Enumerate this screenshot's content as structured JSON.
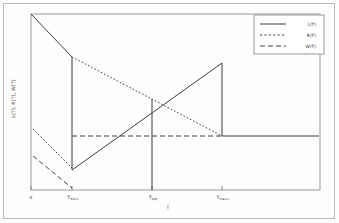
{
  "chart_data": {
    "type": "line",
    "title": "",
    "xlabel": "T",
    "ylabel": "L(T), R(T), W(T)",
    "grid": false,
    "legend_position": "top-right",
    "xlim": [
      0,
      1
    ],
    "ylim": [
      0,
      1
    ],
    "xticks": [
      {
        "pos": 0.0,
        "label": "0",
        "sub": ""
      },
      {
        "pos": 0.142,
        "label": "T",
        "sub": "min,L"
      },
      {
        "pos": 0.662,
        "label": "T",
        "sub": "opt"
      },
      {
        "pos": 0.662,
        "label": "T",
        "sub": "max,L"
      }
    ],
    "tick_labels": [
      "0",
      "T",
      "T",
      "T"
    ],
    "tick_subs": [
      "",
      "min,L",
      "opt",
      "max,L"
    ],
    "series": [
      {
        "name": "L(T)",
        "style": "solid",
        "color": "#3a3a3a",
        "points": [
          [
            0.0,
            1.0
          ],
          [
            0.142,
            0.76
          ],
          [
            0.142,
            0.115
          ],
          [
            0.662,
            0.72
          ],
          [
            0.662,
            0.305
          ],
          [
            1.0,
            0.305
          ]
        ]
      },
      {
        "name": "R(T)",
        "style": "dotted",
        "color": "#3a3a3a",
        "points": [
          [
            0.0,
            0.345
          ],
          [
            0.142,
            0.125
          ],
          [
            0.142,
            0.76
          ],
          [
            0.662,
            0.305
          ]
        ]
      },
      {
        "name": "W(T)",
        "style": "dashed",
        "color": "#3a3a3a",
        "points": [
          [
            0.0,
            0.195
          ],
          [
            0.142,
            0.015
          ],
          [
            0.142,
            0.305
          ],
          [
            0.662,
            0.305
          ]
        ]
      }
    ],
    "legend": [
      {
        "label": "L(T)",
        "style": "solid"
      },
      {
        "label": "R(T)",
        "style": "dotted"
      },
      {
        "label": "W(T)",
        "style": "dashed"
      }
    ],
    "annotations": []
  }
}
